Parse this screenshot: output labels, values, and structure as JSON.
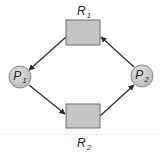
{
  "diagram": {
    "type": "resource-allocation-graph",
    "colors": {
      "resource_fill": "#c4c4c4",
      "resource_stroke": "#6a6a6a",
      "process_fill": "#cfcfcf",
      "process_stroke": "#8a8a8a",
      "edge": "#2a2a2a",
      "label": "#222222"
    },
    "resources": [
      {
        "id": "R1",
        "name": "R",
        "sub": "1",
        "x": 66,
        "y": 20,
        "w": 34,
        "h": 25
      },
      {
        "id": "R2",
        "name": "R",
        "sub": "2",
        "x": 66,
        "y": 104,
        "w": 34,
        "h": 24
      }
    ],
    "processes": [
      {
        "id": "P1",
        "name": "P",
        "sub": "1",
        "cx": 20,
        "cy": 77,
        "r": 11
      },
      {
        "id": "P2",
        "name": "P",
        "sub": "2",
        "cx": 142,
        "cy": 76,
        "r": 11
      }
    ],
    "edges": [
      {
        "from": "R1",
        "to": "P1",
        "kind": "assignment"
      },
      {
        "from": "P1",
        "to": "R2",
        "kind": "request"
      },
      {
        "from": "R2",
        "to": "P2",
        "kind": "assignment"
      },
      {
        "from": "P2",
        "to": "R1",
        "kind": "request"
      }
    ]
  }
}
